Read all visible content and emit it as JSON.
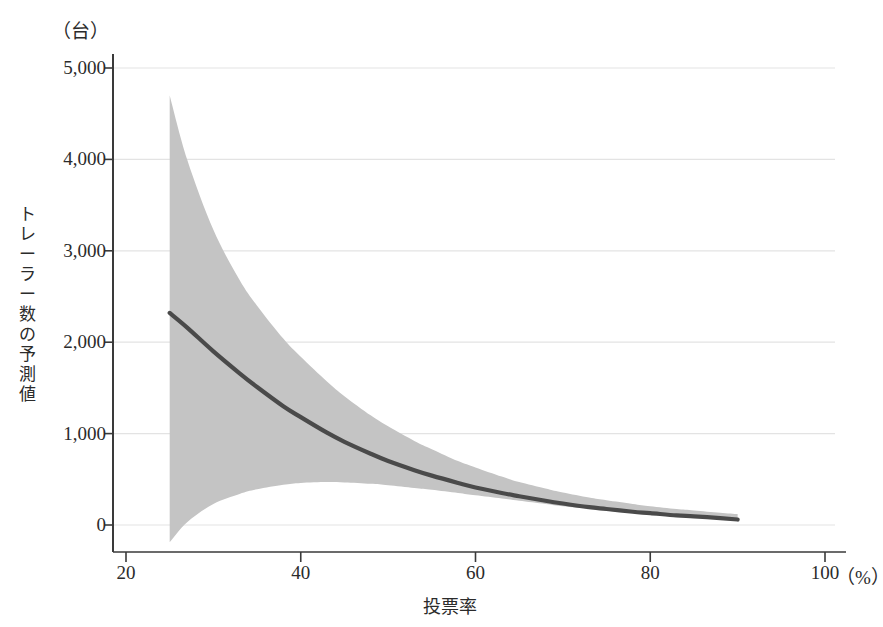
{
  "chart_data": {
    "type": "line",
    "title": "",
    "subtitle": "",
    "xlabel": "投票率",
    "ylabel": "トレーラー数の予測値",
    "x_unit": "（%）",
    "y_unit": "（台）",
    "xlim": [
      20,
      100
    ],
    "ylim": [
      -400,
      5400
    ],
    "xticks": [
      20,
      40,
      60,
      80,
      100
    ],
    "xtick_labels": [
      "20",
      "40",
      "60",
      "80",
      "100"
    ],
    "yticks": [
      0,
      1000,
      2000,
      3000,
      4000,
      5000
    ],
    "ytick_labels": [
      "0",
      "1,000",
      "2,000",
      "3,000",
      "4,000",
      "5,000"
    ],
    "grid": "horizontal",
    "legend": "none",
    "series": [
      {
        "name": "予測値",
        "kind": "line",
        "color": "#4a4a4a",
        "x": [
          25,
          27,
          30,
          33,
          35,
          38,
          40,
          43,
          45,
          48,
          50,
          53,
          55,
          58,
          60,
          63,
          65,
          68,
          70,
          73,
          75,
          78,
          80,
          83,
          85,
          88,
          90
        ],
        "y": [
          2320,
          2160,
          1900,
          1660,
          1510,
          1300,
          1180,
          1010,
          910,
          780,
          700,
          600,
          540,
          460,
          410,
          350,
          315,
          265,
          235,
          195,
          175,
          145,
          130,
          105,
          95,
          75,
          60
        ]
      },
      {
        "name": "95%信頼区間",
        "kind": "band",
        "color": "#c4c4c4",
        "x": [
          25,
          27,
          30,
          33,
          35,
          38,
          40,
          43,
          45,
          48,
          50,
          53,
          55,
          58,
          60,
          63,
          65,
          68,
          70,
          73,
          75,
          78,
          80,
          83,
          85,
          88,
          90
        ],
        "upper": [
          4700,
          4000,
          3230,
          2680,
          2400,
          2040,
          1840,
          1570,
          1410,
          1200,
          1080,
          920,
          830,
          700,
          630,
          530,
          470,
          400,
          355,
          300,
          270,
          230,
          205,
          175,
          160,
          135,
          120
        ],
        "lower": [
          -190,
          30,
          230,
          340,
          390,
          440,
          460,
          470,
          465,
          450,
          435,
          405,
          385,
          350,
          325,
          290,
          265,
          230,
          205,
          175,
          155,
          130,
          115,
          95,
          85,
          65,
          55
        ]
      }
    ],
    "annotations": []
  },
  "colors": {
    "line": "#4a4a4a",
    "band": "#c4c4c4",
    "axis": "#3a3a3a",
    "grid": "#e3e3e3",
    "text": "#2b2b2b",
    "background": "#ffffff"
  }
}
